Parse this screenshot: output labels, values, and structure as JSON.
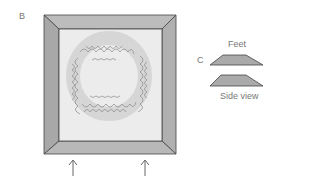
{
  "figure": {
    "panel_b_label": "B",
    "panel_c_label": "C",
    "feet_label": "Feet",
    "side_view_label": "Side view"
  },
  "colors": {
    "frame": "#b4b4b4",
    "frame_edge": "#444444",
    "inner": "#ececec",
    "moss": "#8a8a8a",
    "feet": "#aaaaaa"
  },
  "arrows": [
    {
      "x": 73
    },
    {
      "x": 145
    }
  ]
}
